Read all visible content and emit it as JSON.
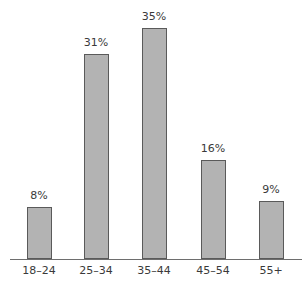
{
  "chart_data": {
    "type": "bar",
    "title": "",
    "xlabel": "",
    "ylabel": "",
    "categories": [
      "18–24",
      "25–34",
      "35–44",
      "45–54",
      "55+"
    ],
    "values": [
      8,
      31,
      35,
      16,
      9
    ],
    "value_labels": [
      "8%",
      "31%",
      "35%",
      "16%",
      "9%"
    ],
    "unit": "%",
    "ylim": [
      0,
      35
    ],
    "grid": false,
    "legend": null,
    "bar_color": "#b3b3b3",
    "bar_edge_color": "#5a5a5a"
  }
}
